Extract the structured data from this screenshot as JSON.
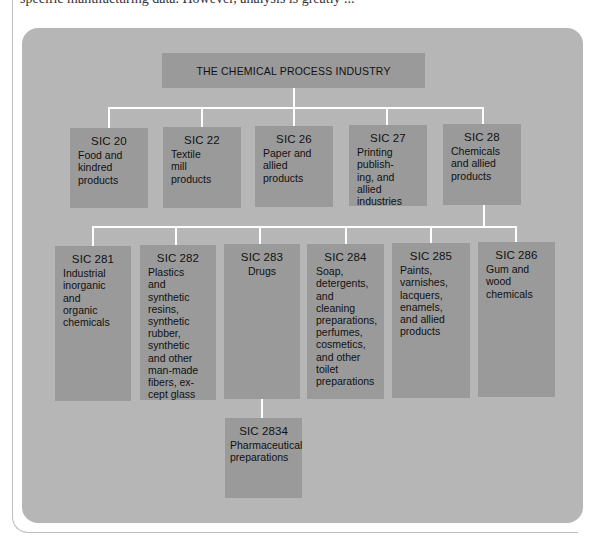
{
  "page": {
    "clipped_text": "specific manufacturing data. However, analysis is greatly ..."
  },
  "colors": {
    "panel": "#b6b6b6",
    "box": "#9a9a9a",
    "connector": "#ffffff",
    "text": "#111111"
  },
  "diagram": {
    "root": {
      "label": "THE CHEMICAL PROCESS INDUSTRY"
    },
    "level1": [
      {
        "code": "SIC 20",
        "desc": "Food and\nkindred\nproducts"
      },
      {
        "code": "SIC 22",
        "desc": "Textile\nmill\nproducts"
      },
      {
        "code": "SIC 26",
        "desc": "Paper and\nallied\nproducts"
      },
      {
        "code": "SIC 27",
        "desc": "Printing\npublish-\ning, and\nallied\nindustries"
      },
      {
        "code": "SIC 28",
        "desc": "Chemicals\nand allied\nproducts"
      }
    ],
    "level2": [
      {
        "code": "SIC 281",
        "desc": "Industrial\ninorganic\nand\norganic\nchemicals"
      },
      {
        "code": "SIC 282",
        "desc": "Plastics\nand\nsynthetic\nresins,\nsynthetic\nrubber,\nsynthetic\nand other\nman-made\nfibers, ex-\ncept glass"
      },
      {
        "code": "SIC 283",
        "desc": "Drugs"
      },
      {
        "code": "SIC 284",
        "desc": "Soap,\ndetergents,\nand\ncleaning\npreparations,\nperfumes,\ncosmetics,\nand other\ntoilet\npreparations"
      },
      {
        "code": "SIC 285",
        "desc": "Paints,\nvarnishes,\nlacquers,\nenamels,\nand allied\nproducts"
      },
      {
        "code": "SIC 286",
        "desc": "Gum and\nwood\nchemicals"
      }
    ],
    "level3": [
      {
        "code": "SIC 2834",
        "desc": "Pharmaceutical\npreparations"
      }
    ]
  }
}
